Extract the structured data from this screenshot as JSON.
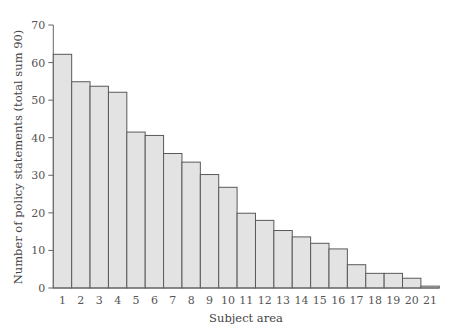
{
  "chart_data": {
    "type": "bar",
    "title": "",
    "xlabel": "Subject area",
    "ylabel": "Number of policy statements (total sum 90)",
    "ylim": [
      0,
      70
    ],
    "yticks": [
      0,
      10,
      20,
      30,
      40,
      50,
      60,
      70
    ],
    "grid": false,
    "legend": null,
    "categories": [
      "1",
      "2",
      "3",
      "4",
      "5",
      "6",
      "7",
      "8",
      "9",
      "10",
      "11",
      "12",
      "13",
      "14",
      "15",
      "16",
      "17",
      "18",
      "19",
      "20",
      "21"
    ],
    "values": [
      62.2,
      54.9,
      53.7,
      52.1,
      41.5,
      40.6,
      35.8,
      33.5,
      30.2,
      26.8,
      19.9,
      18.0,
      15.3,
      13.6,
      11.9,
      10.4,
      6.2,
      3.9,
      3.9,
      2.6,
      0.5
    ],
    "colors": {
      "bar_fill": "#e3e3e3",
      "bar_stroke": "#5a5a5a",
      "axis": "#666666"
    }
  }
}
